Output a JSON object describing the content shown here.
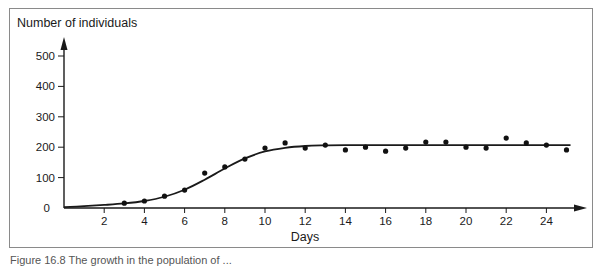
{
  "chart_data": {
    "type": "scatter",
    "title": "",
    "ylabel": "Number of individuals",
    "xlabel": "Days",
    "xlim": [
      0,
      25.5
    ],
    "ylim": [
      0,
      550
    ],
    "grid": false,
    "legend": null,
    "x_ticks": [
      2,
      4,
      6,
      8,
      10,
      12,
      14,
      16,
      18,
      20,
      22,
      24
    ],
    "y_ticks": [
      0,
      100,
      200,
      300,
      400,
      500
    ],
    "series": [
      {
        "name": "Observed",
        "kind": "points",
        "x": [
          3,
          4,
          5,
          6,
          7,
          8,
          9,
          10,
          11,
          12,
          13,
          14,
          15,
          16,
          17,
          18,
          19,
          20,
          21,
          22,
          23,
          24,
          25
        ],
        "values": [
          16,
          23,
          39,
          59,
          115,
          135,
          161,
          197,
          214,
          197,
          207,
          191,
          200,
          187,
          197,
          217,
          217,
          200,
          197,
          230,
          214,
          207,
          191
        ]
      },
      {
        "name": "Logistic fit",
        "kind": "line",
        "x": [
          0,
          1,
          2,
          3,
          4,
          5,
          6,
          7,
          8,
          9,
          10,
          11,
          12,
          13,
          14,
          16,
          18,
          20,
          22,
          24,
          25.2
        ],
        "values": [
          3,
          6,
          10,
          15,
          23,
          37,
          60,
          93,
          130,
          163,
          186,
          198,
          204,
          206,
          207,
          207,
          207,
          207,
          207,
          207,
          207
        ]
      }
    ],
    "annotations": []
  },
  "caption": "Figure 16.8  The growth in the population of ..."
}
